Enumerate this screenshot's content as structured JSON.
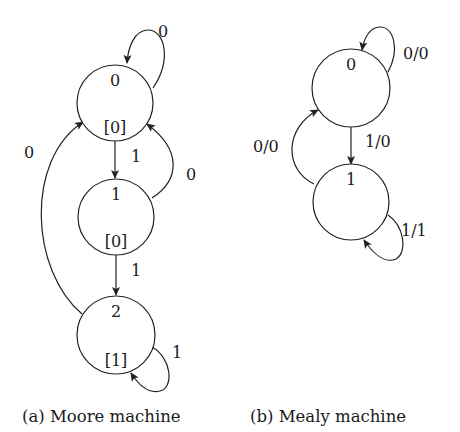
{
  "figure": {
    "moore": {
      "caption": "(a) Moore machine",
      "states": [
        {
          "id": "0",
          "name": "0",
          "output": "[0]",
          "cx": 115,
          "cy": 103,
          "r": 38
        },
        {
          "id": "1",
          "name": "1",
          "output": "[0]",
          "cx": 116,
          "cy": 217,
          "r": 38
        },
        {
          "id": "2",
          "name": "2",
          "output": "[1]",
          "cx": 116,
          "cy": 335,
          "r": 39
        }
      ],
      "transitions": [
        {
          "from": "0",
          "to": "0",
          "label": "0",
          "path": "M 153 88 C 172 60, 165 30, 148 30 C 134 30, 128 48, 127 63",
          "lx": 158,
          "ly": 37
        },
        {
          "from": "0",
          "to": "1",
          "label": "1",
          "path": "M 115 141 L 115 178",
          "lx": 131,
          "ly": 162
        },
        {
          "from": "1",
          "to": "0",
          "label": "0",
          "path": "M 152 198 C 180 180, 182 150, 147 124",
          "lx": 186,
          "ly": 180
        },
        {
          "from": "1",
          "to": "2",
          "label": "1",
          "path": "M 116 255 L 116 295",
          "lx": 131,
          "ly": 276
        },
        {
          "from": "2",
          "to": "0",
          "label": "0",
          "path": "M 82 314 C 30 270, 25 160, 83 122",
          "lx": 24,
          "ly": 158
        },
        {
          "from": "2",
          "to": "2",
          "label": "1",
          "path": "M 152 347 C 172 358, 174 388, 160 391 C 148 394, 138 384, 131 373",
          "lx": 172,
          "ly": 358
        }
      ]
    },
    "mealy": {
      "caption": "(b) Mealy machine",
      "states": [
        {
          "id": "0",
          "name": "0",
          "cx": 351,
          "cy": 88,
          "r": 39
        },
        {
          "id": "1",
          "name": "1",
          "cx": 351,
          "cy": 202,
          "r": 38
        }
      ],
      "transitions": [
        {
          "from": "0",
          "to": "0",
          "label": "0/0",
          "path": "M 388 72 C 400 50, 394 27, 380 27 C 370 27, 364 38, 362 50",
          "lx": 403,
          "ly": 59
        },
        {
          "from": "0",
          "to": "1",
          "label": "1/0",
          "path": "M 351 127 L 351 164",
          "lx": 365,
          "ly": 147
        },
        {
          "from": "1",
          "to": "0",
          "label": "0/0",
          "path": "M 314 184 C 284 170, 284 128, 318 110",
          "lx": 253,
          "ly": 152
        },
        {
          "from": "1",
          "to": "1",
          "label": "1/1",
          "path": "M 388 215 C 404 226, 408 252, 396 259 C 384 264, 372 252, 364 240",
          "lx": 401,
          "ly": 236
        }
      ]
    }
  },
  "style": {
    "stroke_color": "#222222",
    "text_color": "#1a1a1a",
    "background": "#ffffff"
  }
}
